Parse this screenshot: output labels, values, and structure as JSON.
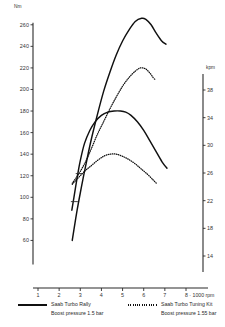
{
  "chart_data": {
    "type": "line",
    "title": "",
    "xlabel": "8 · 1000 rpm",
    "ylabel": "Nm",
    "y2label": "kpm",
    "xlim": [
      1,
      8
    ],
    "ylim": [
      40,
      270
    ],
    "y2lim": [
      12,
      40
    ],
    "grid": false,
    "legend_position": "bottom",
    "x_ticks": [
      "1",
      "2",
      "3",
      "4",
      "5",
      "6",
      "7",
      "8"
    ],
    "x_tick_values": [
      1,
      2,
      3,
      4,
      5,
      6,
      7,
      8
    ],
    "y_ticks": [
      "260",
      "240",
      "220",
      "200",
      "180",
      "160",
      "140",
      "120",
      "100",
      "80",
      "60"
    ],
    "y_tick_values": [
      260,
      240,
      220,
      200,
      180,
      160,
      140,
      120,
      100,
      80,
      60
    ],
    "y2_ticks": [
      "38",
      "34",
      "30",
      "26",
      "22",
      "18",
      "14"
    ],
    "y2_tick_values": [
      38,
      34,
      30,
      26,
      22,
      18,
      14
    ],
    "series": [
      {
        "name": "Saab Turbo Rally power",
        "style": "solid",
        "x": [
          2.62,
          2.7,
          2.85,
          3.0,
          3.2,
          3.5,
          3.8,
          4.1,
          4.4,
          4.7,
          5.0,
          5.3,
          5.6,
          5.9,
          6.1,
          6.35,
          6.6,
          6.85,
          7.05
        ],
        "y": [
          60,
          70,
          88,
          104,
          124,
          152,
          176,
          198,
          216,
          232,
          245,
          255,
          263,
          266,
          265,
          260,
          252,
          245,
          242
        ]
      },
      {
        "name": "Saab Turbo Rally torque",
        "style": "solid",
        "x": [
          2.6,
          2.7,
          2.85,
          3.0,
          3.2,
          3.45,
          3.7,
          4.0,
          4.3,
          4.6,
          4.9,
          5.15,
          5.4,
          5.7,
          6.0,
          6.3,
          6.6,
          6.9,
          7.1
        ],
        "y": [
          88,
          100,
          118,
          134,
          150,
          162,
          170,
          176,
          179,
          180,
          180,
          179,
          176,
          170,
          162,
          152,
          142,
          132,
          127
        ]
      },
      {
        "name": "Saab Turbo Tuning Kit power",
        "style": "dotted",
        "x": [
          2.62,
          2.8,
          3.0,
          3.25,
          3.5,
          3.8,
          4.1,
          4.4,
          4.7,
          5.0,
          5.3,
          5.6,
          5.85,
          6.1,
          6.3,
          6.45,
          6.55
        ],
        "y": [
          113,
          118,
          124,
          133,
          144,
          158,
          170,
          182,
          193,
          203,
          211,
          217,
          220,
          219,
          215,
          211,
          209
        ]
      },
      {
        "name": "Saab Turbo Tuning Kit torque",
        "style": "dotted",
        "x": [
          2.62,
          2.8,
          3.0,
          3.25,
          3.5,
          3.8,
          4.1,
          4.4,
          4.7,
          5.0,
          5.3,
          5.6,
          5.9,
          6.2,
          6.45,
          6.6
        ],
        "y": [
          112,
          116,
          120,
          125,
          129,
          134,
          138,
          140,
          140,
          138,
          135,
          131,
          126,
          121,
          116,
          113
        ]
      }
    ],
    "legend": [
      {
        "style": "solid",
        "title": "Saab Turbo Rally",
        "subtitle": "Boost pressure 1.5 bar"
      },
      {
        "style": "dotted",
        "title": "Saab Turbo Tuning Kit",
        "subtitle": "Boost pressure 1.55 bar"
      }
    ]
  }
}
